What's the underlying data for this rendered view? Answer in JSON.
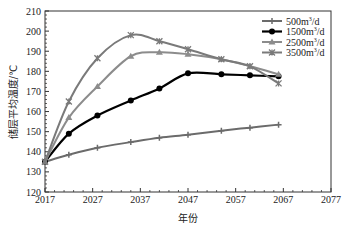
{
  "chart_data": {
    "type": "line",
    "title": "",
    "xlabel": "年份",
    "ylabel": "储层平均温度/℃",
    "xlim": [
      2017,
      2077
    ],
    "ylim": [
      120,
      210
    ],
    "xticks": [
      2017,
      2027,
      2037,
      2047,
      2057,
      2067,
      2077
    ],
    "yticks": [
      120,
      130,
      140,
      150,
      160,
      170,
      180,
      190,
      200,
      210
    ],
    "grid": false,
    "legend_position": "upper right",
    "x": [
      2017,
      2022,
      2028,
      2035,
      2041,
      2047,
      2054,
      2060,
      2066
    ],
    "series": [
      {
        "name": "500m³/d",
        "label_base": "500m",
        "label_sup": "3",
        "label_tail": "/d",
        "color": "#6b6b6b",
        "marker": "plus",
        "width": 2,
        "values": [
          135,
          138.5,
          142,
          144.8,
          147,
          148.5,
          150.5,
          152,
          153.5
        ]
      },
      {
        "name": "1500m³/d",
        "label_base": "1500m",
        "label_sup": "3",
        "label_tail": "/d",
        "color": "#000000",
        "marker": "circle",
        "width": 2.2,
        "values": [
          135,
          149,
          158,
          165.5,
          171.5,
          179,
          178.5,
          178,
          177.5
        ]
      },
      {
        "name": "2500m³/d",
        "label_base": "2500m",
        "label_sup": "3",
        "label_tail": "/d",
        "color": "#8c8c8c",
        "marker": "triangle",
        "width": 2,
        "values": [
          135,
          157,
          172.5,
          187.5,
          189.5,
          188.5,
          186,
          182.5,
          178.5
        ]
      },
      {
        "name": "3500m³/d",
        "label_base": "3500m",
        "label_sup": "3",
        "label_tail": "/d",
        "color": "#7a7a7a",
        "marker": "star",
        "width": 2,
        "values": [
          135,
          165,
          186.5,
          198,
          195,
          191,
          186,
          182.5,
          174
        ]
      }
    ]
  }
}
